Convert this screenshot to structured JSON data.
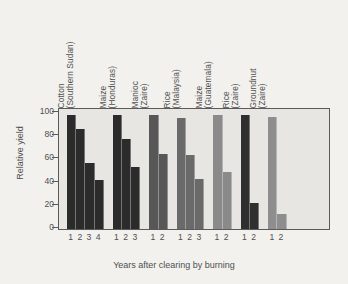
{
  "chart_data": {
    "type": "bar",
    "title": "",
    "xlabel": "Years after clearing by burning",
    "ylabel": "Relative yield",
    "ylim": [
      0,
      100
    ],
    "yticks": [
      0,
      20,
      40,
      60,
      80,
      100
    ],
    "grid": false,
    "legend": "none",
    "groups": [
      {
        "name": "Cotton (Southern Sudan)",
        "crop": "Cotton",
        "region": "(Southern Sudan)",
        "color": "#2b2b2b",
        "x": [
          "1",
          "2",
          "3",
          "4"
        ],
        "values": [
          100,
          88,
          58,
          43
        ]
      },
      {
        "name": "Maize (Honduras)",
        "crop": "Maize",
        "region": "(Honduras)",
        "color": "#2b2b2b",
        "x": [
          "1",
          "2",
          "3"
        ],
        "values": [
          100,
          79,
          54
        ]
      },
      {
        "name": "Manioc (Zaire)",
        "crop": "Manioc",
        "region": "(Zaire)",
        "color": "#575757",
        "x": [
          "1",
          "2"
        ],
        "values": [
          100,
          66
        ]
      },
      {
        "name": "Rice (Malaysia)",
        "crop": "Rice",
        "region": "(Malaysia)",
        "color": "#6a6a6a",
        "x": [
          "1",
          "2",
          "3"
        ],
        "values": [
          97,
          65,
          44
        ]
      },
      {
        "name": "Maize (Guatemala)",
        "crop": "Maize",
        "region": "(Guatemala)",
        "color": "#8a8a8a",
        "x": [
          "1",
          "2"
        ],
        "values": [
          100,
          50
        ]
      },
      {
        "name": "Rice (Zaire)",
        "crop": "Rice",
        "region": "(Zaire)",
        "color": "#2f2f2f",
        "x": [
          "1",
          "2"
        ],
        "values": [
          100,
          23
        ]
      },
      {
        "name": "Groundnut (Zaire)",
        "crop": "Groundnut",
        "region": "(Zaire)",
        "color": "#8e8e8e",
        "x": [
          "1",
          "2"
        ],
        "values": [
          98,
          13
        ]
      }
    ]
  },
  "colors": {
    "page_background": "#f2f1ee",
    "plot_background": "#e7e6e3",
    "frame": "#5a5a5a",
    "text": "#4f4f4f"
  }
}
